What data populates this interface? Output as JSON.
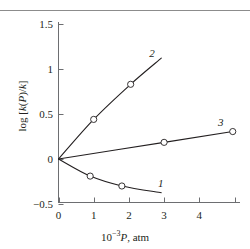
{
  "chart_data": {
    "type": "line",
    "title": "",
    "xlabel": "10−3 P, atm",
    "ylabel": "log [k(P)/k]",
    "xlim": [
      0,
      5
    ],
    "ylim": [
      -0.5,
      1.5
    ],
    "xticks": [
      "0",
      "1",
      "2",
      "3",
      "4"
    ],
    "yticks": [
      "1.5",
      "1",
      "0.5",
      "0",
      "−0.5"
    ],
    "grid": false,
    "legend": "inline-curve-labels",
    "marker": "open-circle",
    "series": [
      {
        "name": "1",
        "label": "1",
        "points": [
          {
            "x": 0.0,
            "y": 0.0
          },
          {
            "x": 0.9,
            "y": -0.19
          },
          {
            "x": 1.8,
            "y": -0.3
          }
        ],
        "curve_end": {
          "x": 2.92,
          "y": -0.375
        },
        "markers": [
          {
            "x": 0.9,
            "y": -0.19
          },
          {
            "x": 1.8,
            "y": -0.3
          }
        ],
        "label_pos": {
          "x": 2.83,
          "y": -0.275
        }
      },
      {
        "name": "2",
        "label": "2",
        "points": [
          {
            "x": 0.0,
            "y": 0.0
          },
          {
            "x": 1.0,
            "y": 0.44
          },
          {
            "x": 2.05,
            "y": 0.83
          }
        ],
        "curve_end": {
          "x": 2.92,
          "y": 1.12
        },
        "markers": [
          {
            "x": 1.0,
            "y": 0.44
          },
          {
            "x": 2.05,
            "y": 0.83
          }
        ],
        "label_pos": {
          "x": 2.58,
          "y": 1.17
        }
      },
      {
        "name": "3",
        "label": "3",
        "points": [
          {
            "x": 0.0,
            "y": 0.0
          },
          {
            "x": 3.0,
            "y": 0.185
          },
          {
            "x": 4.95,
            "y": 0.305
          }
        ],
        "curve_end": {
          "x": 4.95,
          "y": 0.305
        },
        "markers": [
          {
            "x": 3.0,
            "y": 0.185
          },
          {
            "x": 4.95,
            "y": 0.305
          }
        ],
        "label_pos": {
          "x": 4.53,
          "y": 0.4
        }
      }
    ],
    "colors": {
      "axis": "#6d6e71",
      "curve": "#231f20",
      "marker_fill": "#ffffff",
      "text": "#231f20",
      "rule": "#8c8c8c"
    }
  },
  "axis_labels": {
    "x_prefix": "10",
    "x_exponent": "−3",
    "x_var": "P",
    "x_unit": ", atm",
    "y_prefix": "log [",
    "y_var_k1": "k",
    "y_open": "(",
    "y_var_p": "P",
    "y_close": ")/",
    "y_var_k2": "k",
    "y_suffix": "]"
  },
  "ticks": {
    "y": [
      {
        "label": "1.5",
        "value": 1.5
      },
      {
        "label": "1",
        "value": 1.0
      },
      {
        "label": "0.5",
        "value": 0.5
      },
      {
        "label": "0",
        "value": 0.0
      },
      {
        "label": "−0.5",
        "value": -0.5
      }
    ],
    "x": [
      {
        "label": "0",
        "value": 0
      },
      {
        "label": "1",
        "value": 1
      },
      {
        "label": "2",
        "value": 2
      },
      {
        "label": "3",
        "value": 3
      },
      {
        "label": "4",
        "value": 4
      }
    ]
  }
}
